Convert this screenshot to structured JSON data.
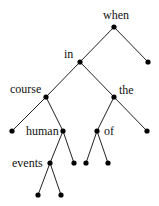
{
  "diagram": {
    "type": "binary-tree",
    "colors": {
      "edge": "#222222",
      "node": "#000000",
      "text": "#111111",
      "background": "#ffffff"
    },
    "nodes": [
      {
        "id": "when",
        "label": "when",
        "x": 114,
        "y": 27,
        "lx": 103,
        "ly": 19,
        "anchor": "start"
      },
      {
        "id": "in",
        "label": "in",
        "x": 80,
        "y": 62,
        "lx": 64,
        "ly": 58,
        "anchor": "start"
      },
      {
        "id": "r1",
        "label": "",
        "x": 148,
        "y": 62
      },
      {
        "id": "course",
        "label": "course",
        "x": 46,
        "y": 97,
        "lx": 10,
        "ly": 93,
        "anchor": "start"
      },
      {
        "id": "the",
        "label": "the",
        "x": 114,
        "y": 97,
        "lx": 119,
        "ly": 94,
        "anchor": "start"
      },
      {
        "id": "l1",
        "label": "",
        "x": 12,
        "y": 131
      },
      {
        "id": "human",
        "label": "human",
        "x": 63,
        "y": 131,
        "lx": 26,
        "ly": 135,
        "anchor": "start"
      },
      {
        "id": "of",
        "label": "of",
        "x": 97,
        "y": 131,
        "lx": 104,
        "ly": 135,
        "anchor": "start"
      },
      {
        "id": "r2",
        "label": "",
        "x": 147,
        "y": 131
      },
      {
        "id": "events",
        "label": "events",
        "x": 50,
        "y": 163,
        "lx": 12,
        "ly": 167,
        "anchor": "start"
      },
      {
        "id": "h2",
        "label": "",
        "x": 74,
        "y": 163
      },
      {
        "id": "o1",
        "label": "",
        "x": 86,
        "y": 163
      },
      {
        "id": "o2",
        "label": "",
        "x": 108,
        "y": 163
      },
      {
        "id": "e1",
        "label": "",
        "x": 38,
        "y": 195
      },
      {
        "id": "e2",
        "label": "",
        "x": 61,
        "y": 195
      }
    ],
    "edges": [
      [
        "when",
        "in"
      ],
      [
        "when",
        "r1"
      ],
      [
        "in",
        "course"
      ],
      [
        "in",
        "the"
      ],
      [
        "course",
        "l1"
      ],
      [
        "course",
        "human"
      ],
      [
        "the",
        "of"
      ],
      [
        "the",
        "r2"
      ],
      [
        "human",
        "events"
      ],
      [
        "human",
        "h2"
      ],
      [
        "of",
        "o1"
      ],
      [
        "of",
        "o2"
      ],
      [
        "events",
        "e1"
      ],
      [
        "events",
        "e2"
      ]
    ],
    "labels": {
      "when": "when",
      "in": "in",
      "course": "course",
      "the": "the",
      "human": "human",
      "of": "of",
      "events": "events"
    }
  }
}
